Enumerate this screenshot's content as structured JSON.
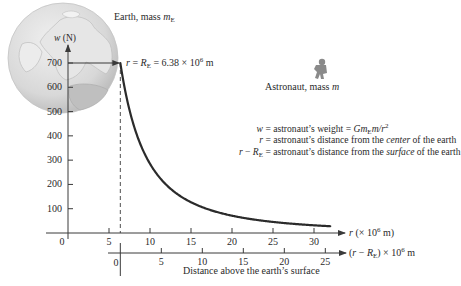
{
  "labels": {
    "earth": "Earth, mass ",
    "earth_mass_symbol": "m",
    "earth_mass_sub": "E",
    "astronaut": "Astronaut, mass ",
    "astronaut_mass_symbol": "m",
    "y_axis": "w (N)",
    "surface_marker_lhs": "r = R",
    "surface_marker_sub": "E",
    "surface_marker_rhs": " = 6.38 × 10",
    "surface_marker_exp": "6",
    "surface_marker_unit": " m",
    "upper_axis": "r (× 10",
    "upper_axis_exp": "6",
    "upper_axis_unit": " m)",
    "lower_axis_pre": "(r − R",
    "lower_axis_sub": "E",
    "lower_axis_post": ") × 10",
    "lower_axis_exp": "6",
    "lower_axis_unit": " m",
    "lower_axis_caption": "Distance above the earth’s surface",
    "origin_upper": "0",
    "origin_lower": "0"
  },
  "legend": [
    {
      "lhs": "w",
      "eq": " = astronaut’s weight = ",
      "rhs_a": "Gm",
      "rhs_sub": "E",
      "rhs_b": "m/r",
      "rhs_exp": "2"
    },
    {
      "lhs": "r",
      "eq": " = astronaut’s distance from the ",
      "em": "center",
      "tail": " of the earth"
    },
    {
      "lhs": "r − R",
      "lhs_sub": "E",
      "eq": " = astronaut’s distance from the ",
      "em": "surface",
      "tail": " of the earth"
    }
  ],
  "chart_data": {
    "type": "line",
    "title": "",
    "xlabel": "r (× 10^6 m)",
    "xlabel_secondary": "(r − R_E) × 10^6 m — Distance above the earth’s surface",
    "ylabel": "w (N)",
    "x_ticks": [
      5,
      10,
      15,
      20,
      25,
      30
    ],
    "x_secondary_ticks": [
      0,
      5,
      10,
      15,
      20,
      25
    ],
    "y_ticks": [
      100,
      200,
      300,
      400,
      500,
      600,
      700
    ],
    "xlim": [
      0,
      33
    ],
    "ylim": [
      0,
      750
    ],
    "earth_radius": 6.38,
    "surface_weight": 700,
    "formula": "w = 700 × (6.38 / r)^2",
    "series": [
      {
        "name": "astronaut's weight",
        "x": [
          6.38,
          7,
          8,
          9,
          10,
          12,
          14,
          16,
          18,
          20,
          22,
          24,
          26,
          28,
          30,
          32
        ],
        "y": [
          700,
          581,
          445,
          352,
          285,
          198,
          145,
          111,
          88,
          71,
          59,
          49,
          42,
          36,
          32,
          28
        ]
      }
    ],
    "annotations": [
      "r = R_E = 6.38 × 10^6 m",
      "Earth, mass m_E",
      "Astronaut, mass m"
    ],
    "grid": false
  },
  "colors": {
    "curve": "#2b2b2b",
    "axis": "#3a3a3a",
    "globe_fill": "#d9d9d9",
    "globe_land": "#a8a8a8",
    "astronaut": "#8a8a8a"
  }
}
